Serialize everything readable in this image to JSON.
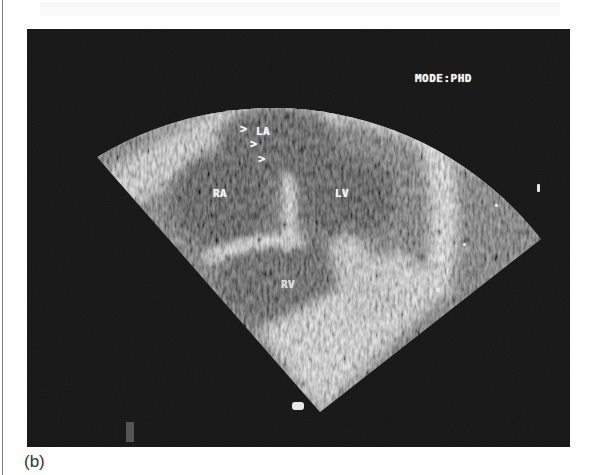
{
  "figure": {
    "caption": "(b)",
    "image_type": "echocardiogram",
    "overlay": {
      "mode_label": "MODE:PHD",
      "chambers": {
        "la": "LA",
        "ra": "RA",
        "lv": "LV",
        "rv": "RV"
      },
      "arrows": [
        ">",
        ">",
        ">"
      ]
    },
    "colors": {
      "background": "#0c0c0c",
      "tissue_bright": "#e8e8e8",
      "page": "#ffffff"
    }
  }
}
